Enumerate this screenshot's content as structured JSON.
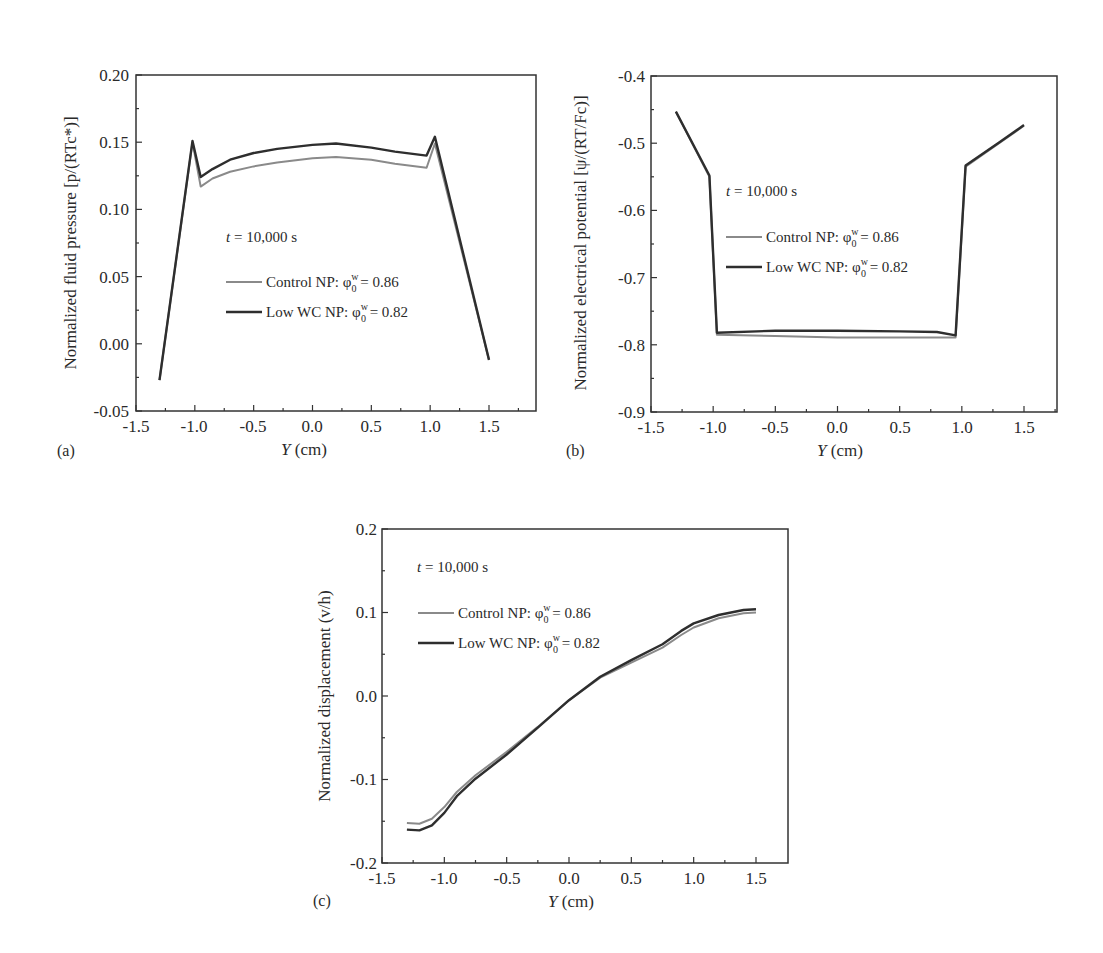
{
  "chart_data": [
    {
      "panel": "(a)",
      "type": "line",
      "title": "",
      "annotation": "t = 10,000 s",
      "xlabel": "Y (cm)",
      "ylabel": "Normalized fluid pressure [p/(RTc*)]",
      "xlim": [
        -1.5,
        1.75
      ],
      "ylim": [
        -0.05,
        0.2
      ],
      "xticks": [
        "-1.5",
        "-1.0",
        "-0.5",
        "0.0",
        "0.5",
        "1.0",
        "1.5"
      ],
      "yticks": [
        "-0.05",
        "0.00",
        "0.05",
        "0.10",
        "0.15",
        "0.20"
      ],
      "grid": false,
      "legend_position": "center",
      "series": [
        {
          "name": "Control NP: φ0w = 0.86",
          "color": "#8a8a8a",
          "x": [
            -1.3,
            -1.02,
            -0.95,
            -0.85,
            -0.7,
            -0.5,
            -0.3,
            0.0,
            0.2,
            0.5,
            0.7,
            0.97,
            1.04,
            1.5
          ],
          "y": [
            -0.027,
            0.15,
            0.117,
            0.123,
            0.128,
            0.132,
            0.135,
            0.138,
            0.139,
            0.137,
            0.134,
            0.131,
            0.149,
            -0.012
          ]
        },
        {
          "name": "Low WC NP: φ0w = 0.82",
          "color": "#2e2e2e",
          "x": [
            -1.3,
            -1.02,
            -0.95,
            -0.85,
            -0.7,
            -0.5,
            -0.3,
            0.0,
            0.2,
            0.5,
            0.7,
            0.97,
            1.04,
            1.5
          ],
          "y": [
            -0.027,
            0.151,
            0.124,
            0.13,
            0.137,
            0.142,
            0.145,
            0.148,
            0.149,
            0.146,
            0.143,
            0.14,
            0.154,
            -0.012
          ]
        }
      ]
    },
    {
      "panel": "(b)",
      "type": "line",
      "title": "",
      "annotation": "t = 10,000 s",
      "xlabel": "Y (cm)",
      "ylabel": "Normalized electrical potential [ψ/(RT/Fc)]",
      "xlim": [
        -1.5,
        1.75
      ],
      "ylim": [
        -0.9,
        -0.4
      ],
      "xticks": [
        "-1.5",
        "-1.0",
        "-0.5",
        "0.0",
        "0.5",
        "1.0",
        "1.5"
      ],
      "yticks": [
        "-0.9",
        "-0.8",
        "-0.7",
        "-0.6",
        "-0.5",
        "-0.4"
      ],
      "grid": false,
      "legend_position": "center",
      "series": [
        {
          "name": "Control NP: φ0w = 0.86",
          "color": "#8a8a8a",
          "x": [
            -1.3,
            -1.03,
            -0.97,
            -0.5,
            0.0,
            0.5,
            0.95,
            1.03,
            1.3,
            1.5
          ],
          "y": [
            -0.453,
            -0.55,
            -0.785,
            -0.787,
            -0.789,
            -0.789,
            -0.789,
            -0.535,
            -0.5,
            -0.474
          ]
        },
        {
          "name": "Low WC NP: φ0w = 0.82",
          "color": "#2e2e2e",
          "x": [
            -1.3,
            -1.03,
            -0.97,
            -0.5,
            0.0,
            0.5,
            0.8,
            0.95,
            1.03,
            1.3,
            1.5
          ],
          "y": [
            -0.453,
            -0.548,
            -0.782,
            -0.779,
            -0.779,
            -0.78,
            -0.781,
            -0.786,
            -0.533,
            -0.499,
            -0.473
          ]
        }
      ]
    },
    {
      "panel": "(c)",
      "type": "line",
      "title": "",
      "annotation": "t = 10,000 s",
      "xlabel": "Y (cm)",
      "ylabel": "Normalized displacement (v/h)",
      "xlim": [
        -1.5,
        1.75
      ],
      "ylim": [
        -0.2,
        0.2
      ],
      "xticks": [
        "-1.5",
        "-1.0",
        "-0.5",
        "0.0",
        "0.5",
        "1.0",
        "1.5"
      ],
      "yticks": [
        "-0.2",
        "-0.1",
        "0.0",
        "0.1",
        "0.2"
      ],
      "grid": false,
      "legend_position": "upper left",
      "series": [
        {
          "name": "Control NP: φ0w = 0.86",
          "color": "#8a8a8a",
          "x": [
            -1.3,
            -1.2,
            -1.1,
            -1.0,
            -0.9,
            -0.75,
            -0.5,
            -0.25,
            0.0,
            0.25,
            0.5,
            0.75,
            0.9,
            1.0,
            1.2,
            1.4,
            1.5
          ],
          "y": [
            -0.152,
            -0.153,
            -0.147,
            -0.133,
            -0.115,
            -0.095,
            -0.067,
            -0.037,
            -0.005,
            0.022,
            0.04,
            0.058,
            0.073,
            0.082,
            0.093,
            0.099,
            0.1
          ]
        },
        {
          "name": "Low WC NP: φ0w = 0.82",
          "color": "#2e2e2e",
          "x": [
            -1.3,
            -1.2,
            -1.1,
            -1.0,
            -0.9,
            -0.75,
            -0.5,
            -0.25,
            0.0,
            0.25,
            0.5,
            0.75,
            0.9,
            1.0,
            1.2,
            1.4,
            1.5
          ],
          "y": [
            -0.16,
            -0.161,
            -0.155,
            -0.14,
            -0.12,
            -0.099,
            -0.07,
            -0.038,
            -0.005,
            0.023,
            0.043,
            0.062,
            0.078,
            0.087,
            0.097,
            0.103,
            0.104
          ]
        }
      ]
    }
  ],
  "panels": {
    "a": {
      "label": "(a)",
      "annotation_t": "t",
      "annotation_rest": " = 10,000 s",
      "xlabel_var": "Y",
      "xlabel_unit": " (cm)",
      "ylabel": "Normalized fluid pressure [p/(RTc*)]",
      "legend": [
        {
          "prefix": "Control NP: ",
          "phi": "φ",
          "sup": "w",
          "sub": "0",
          "value": " = 0.86"
        },
        {
          "prefix": "Low WC NP: ",
          "phi": "φ",
          "sup": "w",
          "sub": "0",
          "value": " = 0.82"
        }
      ]
    },
    "b": {
      "label": "(b)",
      "annotation_t": "t",
      "annotation_rest": " = 10,000 s",
      "xlabel_var": "Y",
      "xlabel_unit": " (cm)",
      "ylabel": "Normalized electrical potential [ψ/(RT/Fc)]",
      "legend": [
        {
          "prefix": "Control NP: ",
          "phi": "φ",
          "sup": "w",
          "sub": "0",
          "value": " = 0.86"
        },
        {
          "prefix": "Low WC NP: ",
          "phi": "φ",
          "sup": "w",
          "sub": "0",
          "value": " = 0.82"
        }
      ]
    },
    "c": {
      "label": "(c)",
      "annotation_t": "t",
      "annotation_rest": " = 10,000 s",
      "xlabel_var": "Y",
      "xlabel_unit": " (cm)",
      "ylabel": "Normalized displacement (v/h)",
      "legend": [
        {
          "prefix": "Control NP: ",
          "phi": "φ",
          "sup": "w",
          "sub": "0",
          "value": " = 0.86"
        },
        {
          "prefix": "Low WC NP: ",
          "phi": "φ",
          "sup": "w",
          "sub": "0",
          "value": " = 0.82"
        }
      ]
    }
  }
}
